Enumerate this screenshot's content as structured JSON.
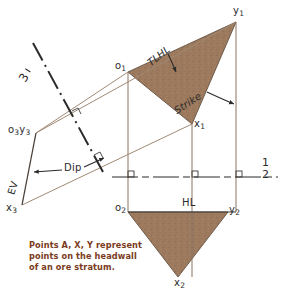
{
  "figure": {
    "caption": "Points A, X, Y represent\npoints on the headwall\nof an ore stratum.",
    "background_color": "#ffffff",
    "fill_color": "#9d7a5e",
    "line_color": "#7a6a5c",
    "dark_line_color": "#3a3a3a",
    "caption_color": "#7a3b21",
    "label_color": "#2b2b2b"
  },
  "labels": {
    "y1": "y",
    "y1_sub": "1",
    "o1": "o",
    "o1_sub": "1",
    "x1": "x",
    "x1_sub": "1",
    "o3y3": "o",
    "o3y3_sub_a": "3",
    "o3y3_mid": "y",
    "o3y3_sub_b": "3",
    "x3": "x",
    "x3_sub": "3",
    "o2": "o",
    "o2_sub": "2",
    "y2": "y",
    "y2_sub": "2",
    "x2": "x",
    "x2_sub": "2",
    "tlhl": "TLHL",
    "strike": "Strike",
    "dip": "Dip",
    "ev": "EV",
    "hl": "HL",
    "fold3": "3",
    "fold_1_2_num": "1",
    "fold_1_2_den": "2"
  },
  "views": {
    "top_view": {
      "name": "view-1-top",
      "points": [
        "o1",
        "x1",
        "y1"
      ],
      "description": "Upper filled triangle o1-x1-y1 in view 1"
    },
    "front_view": {
      "name": "view-2-front",
      "points": [
        "o2",
        "x2",
        "y2"
      ],
      "description": "Lower filled triangle o2-x2-y2 in view 2"
    },
    "auxiliary_view": {
      "name": "view-3-edge",
      "points": [
        "o3y3",
        "x3"
      ],
      "description": "Edge view of the plane in auxiliary view 3"
    }
  },
  "annotations": {
    "fold_line_1_2": "1/2",
    "fold_line_1_3": "1/3",
    "horizontal_line": "HL",
    "true_length_horizontal_line": "TLHL",
    "strike_direction": "Strike",
    "dip_angle": "Dip",
    "edge_view": "EV"
  }
}
